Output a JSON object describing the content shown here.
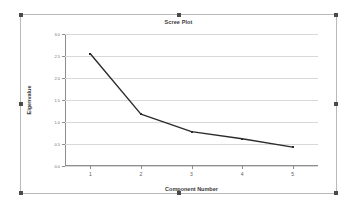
{
  "chart_data": {
    "type": "line",
    "title": "Scree Plot",
    "xlabel": "Component Number",
    "ylabel": "Eigenvalue",
    "categories": [
      "1",
      "2",
      "3",
      "4",
      "5"
    ],
    "x": [
      1,
      2,
      3,
      4,
      5
    ],
    "values": [
      2.55,
      1.18,
      0.78,
      0.62,
      0.43
    ],
    "series": [
      {
        "name": "Eigenvalue",
        "values": [
          2.55,
          1.18,
          0.78,
          0.62,
          0.43
        ]
      }
    ],
    "ylim": [
      0.0,
      3.0
    ],
    "xlim": [
      0.5,
      5.5
    ],
    "yticks": [
      "3.0",
      "2.5",
      "2.0",
      "1.5",
      "1.0",
      "0.5",
      "0.0"
    ],
    "ytick_values": [
      3.0,
      2.5,
      2.0,
      1.5,
      1.0,
      0.5,
      0.0
    ],
    "xticks": [
      "1",
      "2",
      "3",
      "4",
      "5"
    ],
    "grid": true,
    "legend": false,
    "line_color": "#2b2b2b",
    "grid_color": "#d8d8d8",
    "axis_color": "#8d8d8d",
    "background": "#ffffff"
  },
  "selection": {
    "state": "selected",
    "handle_color": "#4a4a4a",
    "frame_color": "#b9b9b9"
  }
}
